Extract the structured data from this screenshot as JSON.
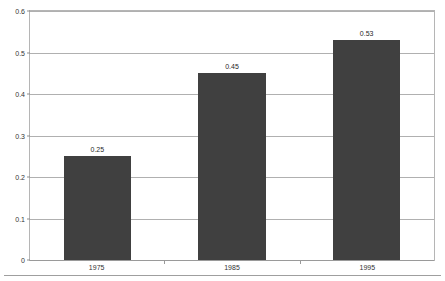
{
  "chart_data": {
    "type": "bar",
    "title": "",
    "subtitle": "",
    "xlabel": "",
    "ylabel": "",
    "categories": [
      "1975",
      "1985",
      "1995"
    ],
    "values": [
      0.25,
      0.45,
      0.53
    ],
    "value_labels": [
      "0.25",
      "0.45",
      "0.53"
    ],
    "series": [
      {
        "name": "",
        "values": [
          0.25,
          0.45,
          0.53
        ]
      }
    ],
    "ylim": [
      0,
      0.6
    ],
    "xlim": [
      0,
      3
    ],
    "y_ticks": [
      0,
      0.1,
      0.2,
      0.3,
      0.4,
      0.5,
      0.6
    ],
    "y_tick_labels": [
      "0",
      "0.1",
      "0.2",
      "0.3",
      "0.4",
      "0.5",
      "0.6"
    ],
    "grid": true,
    "grid_axis": "y",
    "legend": false,
    "legend_position": "none",
    "annotations": [],
    "colors": {
      "bar": "#404040",
      "gridline": "#b0b0b0",
      "plot_border": "#b5b5b5",
      "axis_text": "#333333",
      "value_label": "#1f1f1f",
      "background": "#ffffff",
      "bottom_rule": "#9f9f9f"
    }
  }
}
